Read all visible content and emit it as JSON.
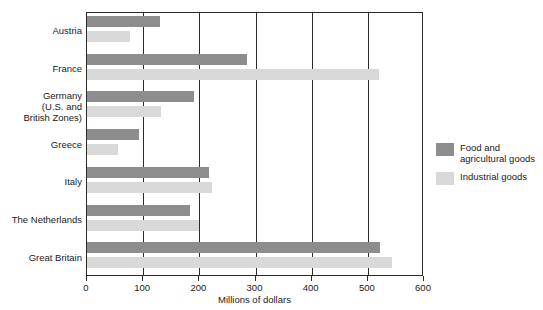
{
  "chart_data": {
    "type": "bar",
    "orientation": "horizontal",
    "title": "",
    "xlabel": "Millions of dollars",
    "ylabel": "",
    "xlim": [
      0,
      600
    ],
    "xticks": [
      0,
      100,
      200,
      300,
      400,
      500,
      600
    ],
    "grid": true,
    "legend_position": "right",
    "categories": [
      "Austria",
      "France",
      "Germany\n(U.S. and\nBritish Zones)",
      "Greece",
      "Italy",
      "The Netherlands",
      "Great Britain"
    ],
    "series": [
      {
        "name": "Food and\nagricultural goods",
        "color": "#8d8d8d",
        "values": [
          130,
          285,
          190,
          92,
          217,
          183,
          521
        ]
      },
      {
        "name": "Industrial goods",
        "color": "#d9d9d9",
        "values": [
          77,
          520,
          132,
          55,
          222,
          199,
          543
        ]
      }
    ]
  },
  "axis": {
    "tick_labels": [
      "0",
      "100",
      "200",
      "300",
      "400",
      "500",
      "600"
    ],
    "title": "Millions of dollars"
  },
  "legend": {
    "items": [
      {
        "label": "Food and\nagricultural goods",
        "color": "#8d8d8d"
      },
      {
        "label": "Industrial goods",
        "color": "#d9d9d9"
      }
    ]
  }
}
